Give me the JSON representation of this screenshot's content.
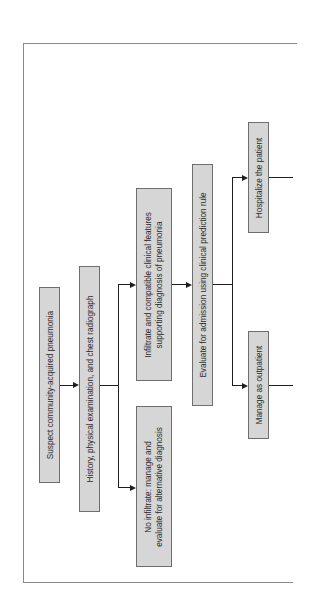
{
  "diagram": {
    "type": "flowchart",
    "orientation": "rotated-90-ccw",
    "nodes": [
      {
        "id": "suspect",
        "label": "Suspect community-acquired pneumonia"
      },
      {
        "id": "history",
        "label": "History, physical examination, and chest radiograph"
      },
      {
        "id": "infiltrate",
        "label_line1": "Infiltrate and compatible clinical features",
        "label_line2": "supporting diagnosis of pneumonia"
      },
      {
        "id": "no_infiltrate",
        "label_line1": "No infiltrate: manage and",
        "label_line2": "evaluate for alternative diagnosis"
      },
      {
        "id": "evaluate",
        "label": "Evaluate for admission using clinical prediction rule"
      },
      {
        "id": "hospitalize",
        "label": "Hospitalize the patient"
      },
      {
        "id": "outpatient",
        "label": "Manage as outpatient"
      }
    ],
    "edges": [
      {
        "from": "suspect",
        "to": "history"
      },
      {
        "from": "history",
        "to": "infiltrate"
      },
      {
        "from": "history",
        "to": "no_infiltrate"
      },
      {
        "from": "infiltrate",
        "to": "evaluate"
      },
      {
        "from": "evaluate",
        "to": "hospitalize"
      },
      {
        "from": "evaluate",
        "to": "outpatient"
      }
    ],
    "colors": {
      "box_fill": "#d6d6d6",
      "box_border": "#6e6e6e",
      "line": "#1e1e1e",
      "frame": "#8a8a8a"
    }
  }
}
